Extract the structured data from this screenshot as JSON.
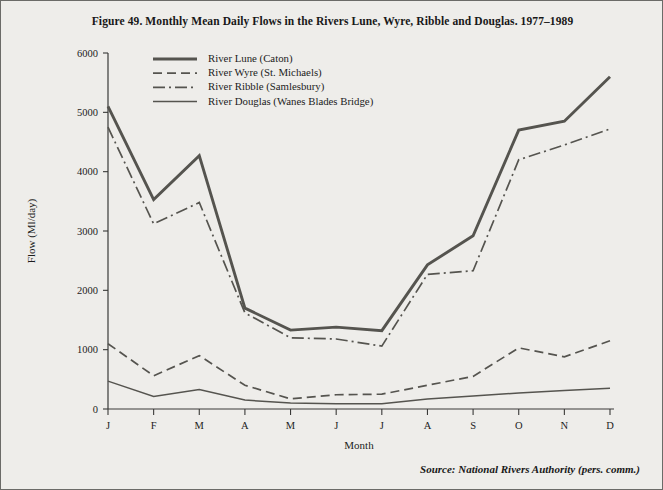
{
  "figure": {
    "title": "Figure 49.  Monthly Mean Daily Flows in the Rivers Lune, Wyre, Ribble and Douglas. 1977–1989",
    "source_note": "Source: National Rivers Authority (pers. comm.)"
  },
  "chart_data": {
    "type": "line",
    "title": "Figure 49.  Monthly Mean Daily Flows in the Rivers Lune, Wyre, Ribble and Douglas. 1977–1989",
    "xlabel": "Month",
    "ylabel": "Flow (Ml/day)",
    "categories": [
      "J",
      "F",
      "M",
      "A",
      "M",
      "J",
      "J",
      "A",
      "S",
      "O",
      "N",
      "D"
    ],
    "xlim": [
      0,
      11
    ],
    "ylim": [
      0,
      6000
    ],
    "yticks": [
      0,
      1000,
      2000,
      3000,
      4000,
      5000,
      6000
    ],
    "ytick_labels": [
      "0",
      "1000",
      "2000",
      "3000",
      "4000",
      "5000",
      "6000"
    ],
    "grid": false,
    "legend_position": "upper-left-inside",
    "series": [
      {
        "name": "River Lune (Caton)",
        "style": "solid-thick",
        "color": "#55544f",
        "width": 2.9,
        "dasharray": "",
        "values": [
          5100,
          3530,
          4270,
          1700,
          1330,
          1380,
          1320,
          2430,
          2920,
          4700,
          4850,
          5600
        ]
      },
      {
        "name": "River Wyre (St. Michaels)",
        "style": "dashed",
        "color": "#55544f",
        "width": 1.7,
        "dasharray": "9,5",
        "values": [
          1100,
          560,
          900,
          400,
          170,
          240,
          250,
          400,
          550,
          1030,
          880,
          1150
        ]
      },
      {
        "name": "River Ribble (Samlesbury)",
        "style": "dash-dot",
        "color": "#55544f",
        "width": 1.7,
        "dasharray": "12,4,2,4",
        "values": [
          4750,
          3120,
          3480,
          1620,
          1200,
          1180,
          1060,
          2270,
          2330,
          4200,
          4450,
          4720
        ]
      },
      {
        "name": "River Douglas (Wanes Blades Bridge)",
        "style": "solid-thin",
        "color": "#55544f",
        "width": 1.5,
        "dasharray": "",
        "values": [
          470,
          210,
          330,
          150,
          100,
          90,
          90,
          170,
          220,
          270,
          310,
          350
        ]
      }
    ]
  }
}
